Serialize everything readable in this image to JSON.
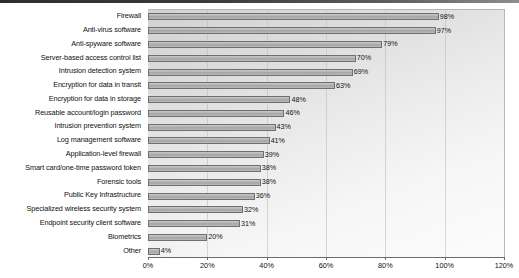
{
  "chart_data": {
    "type": "bar",
    "orientation": "horizontal",
    "title": "",
    "subtitle": "",
    "xlabel": "",
    "ylabel": "",
    "xlim": [
      0,
      120
    ],
    "grid": true,
    "legend": false,
    "legend_position": "none",
    "value_suffix": "%",
    "xticks": [
      "0%",
      "20%",
      "40%",
      "60%",
      "80%",
      "100%",
      "120%"
    ],
    "xtick_values": [
      0,
      20,
      40,
      60,
      80,
      100,
      120
    ],
    "categories": [
      "Firewall",
      "Anti-virus software",
      "Anti-spyware software",
      "Server-based access control list",
      "Intrusion detection system",
      "Encryption for data in transit",
      "Encryption for data in storage",
      "Reusable account/login password",
      "Intrusion prevention system",
      "Log management software",
      "Application-level firewall",
      "Smart card/one-time password token",
      "Forensic tools",
      "Public Key Infrastructure",
      "Specialized wireless security system",
      "Endpoint security client software",
      "Biometrics",
      "Other"
    ],
    "values": [
      98,
      97,
      79,
      70,
      69,
      63,
      48,
      46,
      43,
      41,
      39,
      38,
      38,
      36,
      32,
      31,
      20,
      4
    ],
    "data_labels": [
      "98%",
      "97%",
      "79%",
      "70%",
      "69%",
      "63%",
      "48%",
      "46%",
      "43%",
      "41%",
      "39%",
      "38%",
      "38%",
      "36%",
      "32%",
      "31%",
      "20%",
      "4%"
    ]
  },
  "style": {
    "bar_fill": "#b0b0b0",
    "bar_border": "#6f6f6f",
    "plot_background": "#e6e6e6",
    "gridline_color": "#b9b9b9",
    "axis_color": "#6b6b6b",
    "text_color": "#111111"
  }
}
